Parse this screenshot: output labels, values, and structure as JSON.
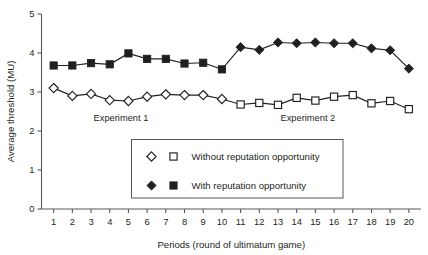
{
  "chart_data": {
    "type": "line",
    "title": "",
    "xlabel": "Periods (round of ultimatum game)",
    "ylabel": "Average threshold (MU)",
    "xlim": [
      0.35,
      20.65
    ],
    "ylim": [
      0,
      5
    ],
    "yticks": [
      0,
      1,
      2,
      3,
      4,
      5
    ],
    "ytick_labels": [
      "0",
      "1",
      "2",
      "3",
      "4",
      "5"
    ],
    "x": [
      1,
      2,
      3,
      4,
      5,
      6,
      7,
      8,
      9,
      10,
      11,
      12,
      13,
      14,
      15,
      16,
      17,
      18,
      19,
      20
    ],
    "xtick_labels": [
      "1",
      "2",
      "3",
      "4",
      "5",
      "6",
      "7",
      "8",
      "9",
      "10",
      "11",
      "12",
      "13",
      "14",
      "15",
      "16",
      "17",
      "18",
      "19",
      "20"
    ],
    "grid": false,
    "legend_position": "inside-center",
    "series": [
      {
        "name": "Without reputation opportunity",
        "marker": "open-diamond",
        "marker_exp2": "open-square",
        "color": "#231f20",
        "fill": "#ffffff",
        "categories": [
          1,
          2,
          3,
          4,
          5,
          6,
          7,
          8,
          9,
          10,
          11,
          12,
          13,
          14,
          15,
          16,
          17,
          18,
          19,
          20
        ],
        "values": [
          3.1,
          2.9,
          2.95,
          2.79,
          2.77,
          2.88,
          2.94,
          2.92,
          2.92,
          2.82,
          2.68,
          2.72,
          2.67,
          2.85,
          2.78,
          2.88,
          2.92,
          2.71,
          2.77,
          2.56
        ]
      },
      {
        "name": "With reputation opportunity",
        "marker": "filled-square",
        "marker_exp2": "filled-diamond",
        "color": "#231f20",
        "fill": "#231f20",
        "categories": [
          1,
          2,
          3,
          4,
          5,
          6,
          7,
          8,
          9,
          10,
          11,
          12,
          13,
          14,
          15,
          16,
          17,
          18,
          19,
          20
        ],
        "values": [
          3.68,
          3.68,
          3.74,
          3.71,
          3.99,
          3.85,
          3.85,
          3.73,
          3.75,
          3.58,
          4.15,
          4.08,
          4.27,
          4.25,
          4.27,
          4.25,
          4.25,
          4.12,
          4.07,
          3.6
        ]
      }
    ],
    "annotations": [
      {
        "text": "Experiment 1",
        "x": 4.6,
        "y": 2.25
      },
      {
        "text": "Experiment 2",
        "x": 14.6,
        "y": 2.25
      }
    ],
    "split_after_period": 10
  },
  "legend": {
    "entries": [
      {
        "label": "Without reputation opportunity",
        "marker_a": "open-diamond",
        "marker_b": "open-square"
      },
      {
        "label": "With reputation opportunity",
        "marker_a": "filled-diamond",
        "marker_b": "filled-square"
      }
    ]
  }
}
